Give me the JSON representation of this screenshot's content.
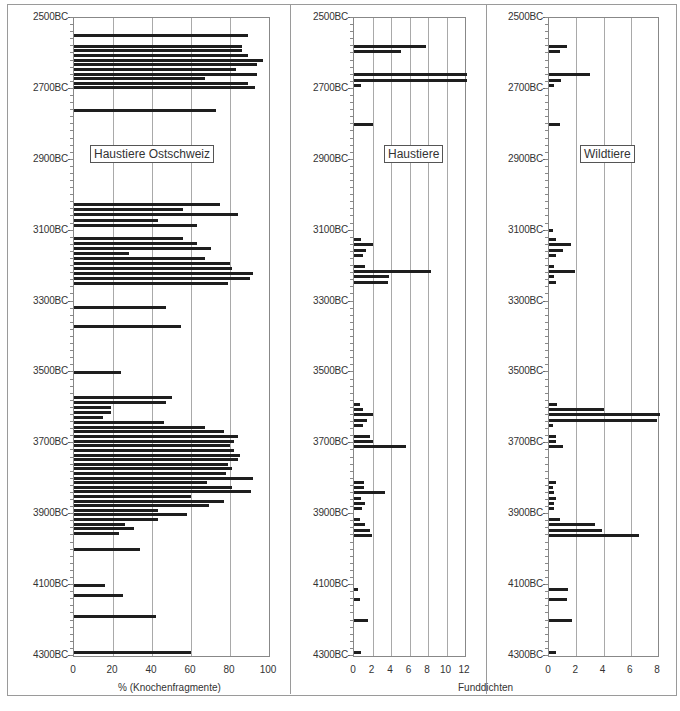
{
  "chart_data": [
    {
      "type": "bar",
      "orientation": "horizontal",
      "title": "Haustiere Ostschweiz",
      "xlabel": "% (Knochenfragmente)",
      "ylabel": "",
      "xlim": [
        0,
        100
      ],
      "xticks": [
        "0",
        "20",
        "40",
        "60",
        "80",
        "100"
      ],
      "yticks": [
        "2500BC",
        "2700BC",
        "2900BC",
        "3100BC",
        "3300BC",
        "3500BC",
        "3700BC",
        "3900BC",
        "4100BC",
        "4300BC"
      ],
      "ylim": [
        2500,
        4300
      ],
      "grid": true,
      "legend_position": "inside-top",
      "bars": [
        {
          "year": 2550,
          "value": 89
        },
        {
          "year": 2580,
          "value": 86
        },
        {
          "year": 2593,
          "value": 86
        },
        {
          "year": 2606,
          "value": 89
        },
        {
          "year": 2619,
          "value": 97
        },
        {
          "year": 2632,
          "value": 94
        },
        {
          "year": 2645,
          "value": 83
        },
        {
          "year": 2658,
          "value": 94
        },
        {
          "year": 2671,
          "value": 67
        },
        {
          "year": 2684,
          "value": 89
        },
        {
          "year": 2697,
          "value": 93
        },
        {
          "year": 2760,
          "value": 73
        },
        {
          "year": 3025,
          "value": 75
        },
        {
          "year": 3040,
          "value": 56
        },
        {
          "year": 3055,
          "value": 84
        },
        {
          "year": 3070,
          "value": 43
        },
        {
          "year": 3085,
          "value": 63
        },
        {
          "year": 3122,
          "value": 56
        },
        {
          "year": 3136,
          "value": 63
        },
        {
          "year": 3150,
          "value": 70
        },
        {
          "year": 3164,
          "value": 28
        },
        {
          "year": 3178,
          "value": 67
        },
        {
          "year": 3192,
          "value": 80
        },
        {
          "year": 3206,
          "value": 81
        },
        {
          "year": 3220,
          "value": 92
        },
        {
          "year": 3234,
          "value": 90
        },
        {
          "year": 3248,
          "value": 79
        },
        {
          "year": 3316,
          "value": 47
        },
        {
          "year": 3370,
          "value": 55
        },
        {
          "year": 3500,
          "value": 24
        },
        {
          "year": 3572,
          "value": 50
        },
        {
          "year": 3586,
          "value": 47
        },
        {
          "year": 3600,
          "value": 19
        },
        {
          "year": 3614,
          "value": 19
        },
        {
          "year": 3628,
          "value": 15
        },
        {
          "year": 3642,
          "value": 46
        },
        {
          "year": 3655,
          "value": 67
        },
        {
          "year": 3668,
          "value": 77
        },
        {
          "year": 3681,
          "value": 84
        },
        {
          "year": 3694,
          "value": 82
        },
        {
          "year": 3707,
          "value": 80
        },
        {
          "year": 3720,
          "value": 82
        },
        {
          "year": 3733,
          "value": 85
        },
        {
          "year": 3746,
          "value": 84
        },
        {
          "year": 3759,
          "value": 79
        },
        {
          "year": 3772,
          "value": 81
        },
        {
          "year": 3785,
          "value": 78
        },
        {
          "year": 3798,
          "value": 92
        },
        {
          "year": 3811,
          "value": 68
        },
        {
          "year": 3824,
          "value": 81
        },
        {
          "year": 3837,
          "value": 91
        },
        {
          "year": 3850,
          "value": 60
        },
        {
          "year": 3863,
          "value": 77
        },
        {
          "year": 3876,
          "value": 69
        },
        {
          "year": 3889,
          "value": 43
        },
        {
          "year": 3902,
          "value": 58
        },
        {
          "year": 3915,
          "value": 43
        },
        {
          "year": 3928,
          "value": 26
        },
        {
          "year": 3941,
          "value": 31
        },
        {
          "year": 3954,
          "value": 23
        },
        {
          "year": 4000,
          "value": 34
        },
        {
          "year": 4100,
          "value": 16
        },
        {
          "year": 4128,
          "value": 25
        },
        {
          "year": 4188,
          "value": 42
        },
        {
          "year": 4290,
          "value": 60
        }
      ]
    },
    {
      "type": "bar",
      "orientation": "horizontal",
      "title": "Haustiere",
      "xlabel": "Funddichten",
      "ylabel": "",
      "xlim": [
        0,
        12
      ],
      "xticks": [
        "0",
        "2",
        "4",
        "6",
        "8",
        "10",
        "12"
      ],
      "yticks": [
        "2500BC",
        "2700BC",
        "2900BC",
        "3100BC",
        "3300BC",
        "3500BC",
        "3700BC",
        "3900BC",
        "4100BC",
        "4300BC"
      ],
      "ylim": [
        2500,
        4300
      ],
      "grid": true,
      "legend_position": "inside-top",
      "bars": [
        {
          "year": 2580,
          "value": 7.8
        },
        {
          "year": 2595,
          "value": 5.1
        },
        {
          "year": 2660,
          "value": 12.5
        },
        {
          "year": 2675,
          "value": 12.5
        },
        {
          "year": 2690,
          "value": 0.8
        },
        {
          "year": 2800,
          "value": 2.1
        },
        {
          "year": 3125,
          "value": 0.8
        },
        {
          "year": 3140,
          "value": 2.1
        },
        {
          "year": 3155,
          "value": 1.3
        },
        {
          "year": 3170,
          "value": 1.0
        },
        {
          "year": 3200,
          "value": 1.2
        },
        {
          "year": 3215,
          "value": 8.3
        },
        {
          "year": 3230,
          "value": 3.8
        },
        {
          "year": 3245,
          "value": 3.7
        },
        {
          "year": 3590,
          "value": 0.6
        },
        {
          "year": 3605,
          "value": 1.0
        },
        {
          "year": 3620,
          "value": 2.0
        },
        {
          "year": 3635,
          "value": 1.4
        },
        {
          "year": 3650,
          "value": 1.0
        },
        {
          "year": 3680,
          "value": 1.7
        },
        {
          "year": 3695,
          "value": 2.0
        },
        {
          "year": 3710,
          "value": 5.6
        },
        {
          "year": 3810,
          "value": 1.1
        },
        {
          "year": 3825,
          "value": 1.1
        },
        {
          "year": 3840,
          "value": 3.4
        },
        {
          "year": 3855,
          "value": 0.8
        },
        {
          "year": 3870,
          "value": 1.2
        },
        {
          "year": 3885,
          "value": 0.9
        },
        {
          "year": 3915,
          "value": 0.7
        },
        {
          "year": 3930,
          "value": 1.2
        },
        {
          "year": 3945,
          "value": 1.7
        },
        {
          "year": 3960,
          "value": 1.9
        },
        {
          "year": 4112,
          "value": 0.4
        },
        {
          "year": 4140,
          "value": 0.6
        },
        {
          "year": 4200,
          "value": 1.5
        },
        {
          "year": 4290,
          "value": 0.8
        }
      ]
    },
    {
      "type": "bar",
      "orientation": "horizontal",
      "title": "Wildtiere",
      "xlabel": "Funddichten",
      "ylabel": "",
      "xlim": [
        0,
        8
      ],
      "xticks": [
        "0",
        "2",
        "4",
        "6",
        "8"
      ],
      "yticks": [
        "2500BC",
        "2700BC",
        "2900BC",
        "3100BC",
        "3300BC",
        "3500BC",
        "3700BC",
        "3900BC",
        "4100BC",
        "4300BC"
      ],
      "ylim": [
        2500,
        4300
      ],
      "grid": true,
      "legend_position": "inside-top",
      "bars": [
        {
          "year": 2580,
          "value": 1.3
        },
        {
          "year": 2595,
          "value": 0.8
        },
        {
          "year": 2660,
          "value": 3.0
        },
        {
          "year": 2675,
          "value": 0.9
        },
        {
          "year": 2690,
          "value": 0.4
        },
        {
          "year": 2800,
          "value": 0.8
        },
        {
          "year": 3100,
          "value": 0.3
        },
        {
          "year": 3125,
          "value": 0.5
        },
        {
          "year": 3140,
          "value": 1.6
        },
        {
          "year": 3155,
          "value": 1.0
        },
        {
          "year": 3170,
          "value": 0.5
        },
        {
          "year": 3200,
          "value": 0.4
        },
        {
          "year": 3215,
          "value": 1.9
        },
        {
          "year": 3230,
          "value": 0.4
        },
        {
          "year": 3245,
          "value": 0.5
        },
        {
          "year": 3590,
          "value": 0.6
        },
        {
          "year": 3605,
          "value": 4.0
        },
        {
          "year": 3620,
          "value": 8.3
        },
        {
          "year": 3635,
          "value": 7.9
        },
        {
          "year": 3650,
          "value": 0.3
        },
        {
          "year": 3680,
          "value": 0.5
        },
        {
          "year": 3695,
          "value": 0.5
        },
        {
          "year": 3710,
          "value": 1.0
        },
        {
          "year": 3810,
          "value": 0.5
        },
        {
          "year": 3825,
          "value": 0.3
        },
        {
          "year": 3840,
          "value": 0.4
        },
        {
          "year": 3855,
          "value": 0.5
        },
        {
          "year": 3870,
          "value": 0.4
        },
        {
          "year": 3885,
          "value": 0.4
        },
        {
          "year": 3915,
          "value": 0.8
        },
        {
          "year": 3930,
          "value": 3.4
        },
        {
          "year": 3945,
          "value": 3.9
        },
        {
          "year": 3960,
          "value": 6.6
        },
        {
          "year": 4112,
          "value": 1.4
        },
        {
          "year": 4140,
          "value": 1.3
        },
        {
          "year": 4200,
          "value": 1.7
        },
        {
          "year": 4290,
          "value": 0.5
        }
      ]
    }
  ],
  "panels": {
    "left": {
      "legend": "Haustiere Ostschweiz",
      "xlabel": "% (Knochenfragmente)",
      "xticks": [
        "0",
        "20",
        "40",
        "60",
        "80",
        "100"
      ]
    },
    "middle": {
      "legend": "Haustiere",
      "xlabel": "Funddichten",
      "xticks": [
        "0",
        "2",
        "4",
        "6",
        "8",
        "10",
        "12"
      ]
    },
    "right": {
      "legend": "Wildtiere",
      "xticks": [
        "0",
        "2",
        "4",
        "6",
        "8"
      ]
    },
    "yticks": [
      "2500BC",
      "2700BC",
      "2900BC",
      "3100BC",
      "3300BC",
      "3500BC",
      "3700BC",
      "3900BC",
      "4100BC",
      "4300BC"
    ]
  }
}
